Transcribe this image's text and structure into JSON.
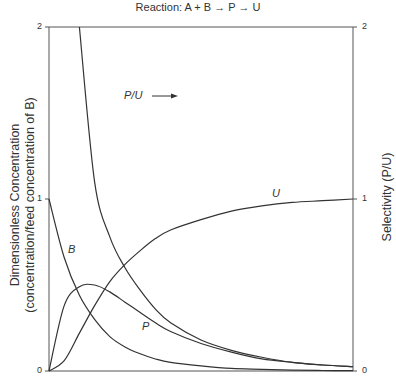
{
  "chart_data": {
    "type": "line",
    "title": "Reaction: A + B → P → U",
    "xlabel": "",
    "ylabel": "Dimensionless Concentration (concentration/feed concentration of B)",
    "ylabel_right": "Selectivity (P/U)",
    "ylim": [
      0,
      2
    ],
    "ylim_right": [
      0,
      2
    ],
    "yticks": [
      "0",
      "1",
      "2"
    ],
    "yticks_right": [
      "0",
      "1",
      "2"
    ],
    "x": [
      0,
      0.5,
      1,
      1.5,
      2,
      2.5,
      3,
      3.5,
      4,
      5,
      6,
      7,
      8,
      9,
      10
    ],
    "series": [
      {
        "name": "B",
        "axis": "left",
        "values": [
          1.0,
          0.66,
          0.44,
          0.3,
          0.2,
          0.14,
          0.1,
          0.07,
          0.05,
          0.03,
          0.015,
          0.01,
          0.005,
          0.003,
          0.002
        ]
      },
      {
        "name": "P",
        "axis": "left",
        "values": [
          0.0,
          0.38,
          0.49,
          0.5,
          0.46,
          0.4,
          0.34,
          0.28,
          0.23,
          0.16,
          0.11,
          0.07,
          0.05,
          0.035,
          0.025
        ]
      },
      {
        "name": "U",
        "axis": "left",
        "values": [
          0.0,
          0.06,
          0.22,
          0.38,
          0.52,
          0.62,
          0.7,
          0.77,
          0.82,
          0.88,
          0.93,
          0.96,
          0.98,
          0.99,
          1.0
        ]
      },
      {
        "name": "P/U",
        "axis": "right",
        "values": [
          null,
          null,
          2.0,
          1.1,
          0.78,
          0.6,
          0.47,
          0.36,
          0.28,
          0.18,
          0.12,
          0.08,
          0.05,
          0.035,
          0.025
        ]
      }
    ],
    "annotations": [
      {
        "text": "P/U →",
        "note": "arrow points to right axis"
      },
      {
        "text": "B"
      },
      {
        "text": "P"
      },
      {
        "text": "U"
      }
    ],
    "grid": false,
    "legend": "none (inline curve labels)"
  },
  "labels": {
    "title": "Reaction:  A + B → P → U",
    "ylabel_left_1": "Dimensionless Concentration",
    "ylabel_left_2": "(concentration/feed concentration of B)",
    "ylabel_right": "Selectivity (P/U)",
    "curve_B": "B",
    "curve_P": "P",
    "curve_U": "U",
    "curve_PU": "P/U",
    "tick_left_0": "0",
    "tick_left_1": "1",
    "tick_left_2": "2",
    "tick_right_0": "0",
    "tick_right_1": "1",
    "tick_right_2": "2"
  }
}
